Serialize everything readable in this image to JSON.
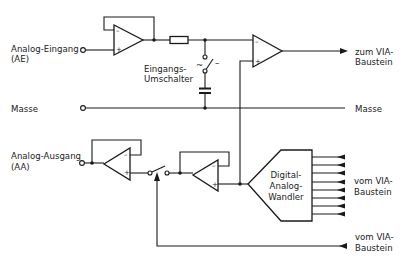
{
  "diagram": {
    "type": "circuit-block-diagram",
    "labels": {
      "analog_input_line1": "Analog-Eingang",
      "analog_input_line2": "(AE)",
      "input_switch_line1": "Eingangs-",
      "input_switch_line2": "Umschalter",
      "ground_left": "Masse",
      "ground_right": "Masse",
      "to_via_line1": "zum VIA-",
      "to_via_line2": "Baustein",
      "analog_output_line1": "Analog-Ausgang",
      "analog_output_line2": "(AA)",
      "dac_line1": "Digital-",
      "dac_line2": "Analog-",
      "dac_line3": "Wandler",
      "from_via_data_line1": "vom VIA-",
      "from_via_data_line2": "Baustein",
      "from_via_ctrl_line1": "vom VIA-",
      "from_via_ctrl_line2": "Baustein"
    },
    "symbols": {
      "minus": "–",
      "plus": "+",
      "switch_ac": "~",
      "switch_dc": "–"
    },
    "components": [
      {
        "id": "opamp-input-buffer",
        "kind": "op-amp"
      },
      {
        "id": "resistor",
        "kind": "resistor"
      },
      {
        "id": "input-selector-switch",
        "kind": "switch"
      },
      {
        "id": "coupling-capacitor",
        "kind": "capacitor"
      },
      {
        "id": "opamp-comparator",
        "kind": "op-amp"
      },
      {
        "id": "opamp-output-buffer",
        "kind": "op-amp"
      },
      {
        "id": "output-switch",
        "kind": "switch"
      },
      {
        "id": "opamp-dac-buffer",
        "kind": "op-amp"
      },
      {
        "id": "dac",
        "kind": "digital-analog-converter"
      }
    ],
    "dac_input_lines": 8
  }
}
